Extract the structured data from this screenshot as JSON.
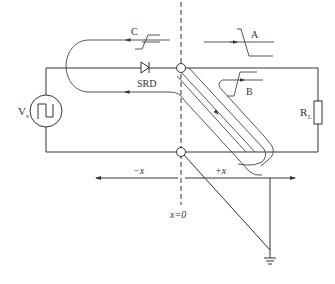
{
  "diagram": {
    "type": "circuit-schematic",
    "labels": {
      "source": "V",
      "source_sub": "s",
      "load": "R",
      "load_sub": "L",
      "diode": "SRD",
      "wave_a": "A",
      "wave_b": "B",
      "wave_c": "C",
      "neg_x": "−x",
      "pos_x": "+x",
      "origin": "x=0"
    },
    "components": [
      {
        "id": "source",
        "kind": "square-wave-voltage-source"
      },
      {
        "id": "srd",
        "kind": "step-recovery-diode"
      },
      {
        "id": "load",
        "kind": "resistor"
      },
      {
        "id": "ground",
        "kind": "ground"
      },
      {
        "id": "transmission-line",
        "kind": "shorted-stub-diagonal"
      }
    ],
    "colors": {
      "stroke": "#333333",
      "background": "#ffffff"
    }
  }
}
